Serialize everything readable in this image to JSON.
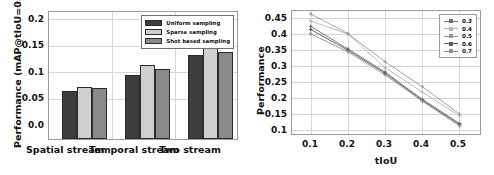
{
  "figure": {
    "background": "#ffffff",
    "panels": [
      "bar-chart-panel",
      "line-chart-panel"
    ]
  },
  "chart_data": [
    {
      "id": "bar-chart",
      "type": "bar",
      "title": "",
      "xlabel": "",
      "ylabel": "Performance (mAP@tIoU=0.5)",
      "categories": [
        "Spatial stream",
        "Temporal stream",
        "Two stream"
      ],
      "yticks": [
        "0.0",
        "0.05",
        "0.1",
        "0.15",
        "0.2"
      ],
      "ytick_values": [
        0.0,
        0.05,
        0.1,
        0.15,
        0.2
      ],
      "ylim": [
        0.0,
        0.225
      ],
      "grid": true,
      "legend_position": "upper right",
      "series": [
        {
          "name": "Uniform sampling",
          "color": "#3d3d3d",
          "values": [
            0.083,
            0.111,
            0.147
          ]
        },
        {
          "name": "Sparse sampling",
          "color": "#cfcfcf",
          "values": [
            0.091,
            0.128,
            0.158
          ]
        },
        {
          "name": "Shot based sampling",
          "color": "#8a8a8a",
          "values": [
            0.088,
            0.122,
            0.152
          ]
        }
      ]
    },
    {
      "id": "line-chart",
      "type": "line",
      "title": "",
      "xlabel": "tIoU",
      "ylabel": "Performance",
      "x": [
        0.1,
        0.2,
        0.3,
        0.4,
        0.5
      ],
      "xticks": [
        "0.1",
        "0.2",
        "0.3",
        "0.4",
        "0.5"
      ],
      "yticks": [
        "0.1",
        "0.15",
        "0.2",
        "0.25",
        "0.3",
        "0.35",
        "0.4",
        "0.45"
      ],
      "ytick_values": [
        0.1,
        0.15,
        0.2,
        0.25,
        0.3,
        0.35,
        0.4,
        0.45
      ],
      "xlim": [
        0.05,
        0.56
      ],
      "ylim": [
        0.088,
        0.487
      ],
      "grid": true,
      "legend_position": "upper right",
      "marker": "plus",
      "series": [
        {
          "name": "0.3",
          "color": "#6f6f6f",
          "values": [
            0.438,
            0.366,
            0.292,
            0.205,
            0.128
          ]
        },
        {
          "name": "0.4",
          "color": "#b4b4b4",
          "values": [
            0.455,
            0.414,
            0.306,
            0.228,
            0.152
          ]
        },
        {
          "name": "0.5",
          "color": "#9a9a9a",
          "values": [
            0.478,
            0.415,
            0.325,
            0.245,
            0.158
          ]
        },
        {
          "name": "0.6",
          "color": "#5a5a5a",
          "values": [
            0.428,
            0.362,
            0.288,
            0.202,
            0.124
          ]
        },
        {
          "name": "0.7",
          "color": "#8c8c8c",
          "values": [
            0.414,
            0.357,
            0.283,
            0.199,
            0.12
          ]
        }
      ]
    }
  ]
}
